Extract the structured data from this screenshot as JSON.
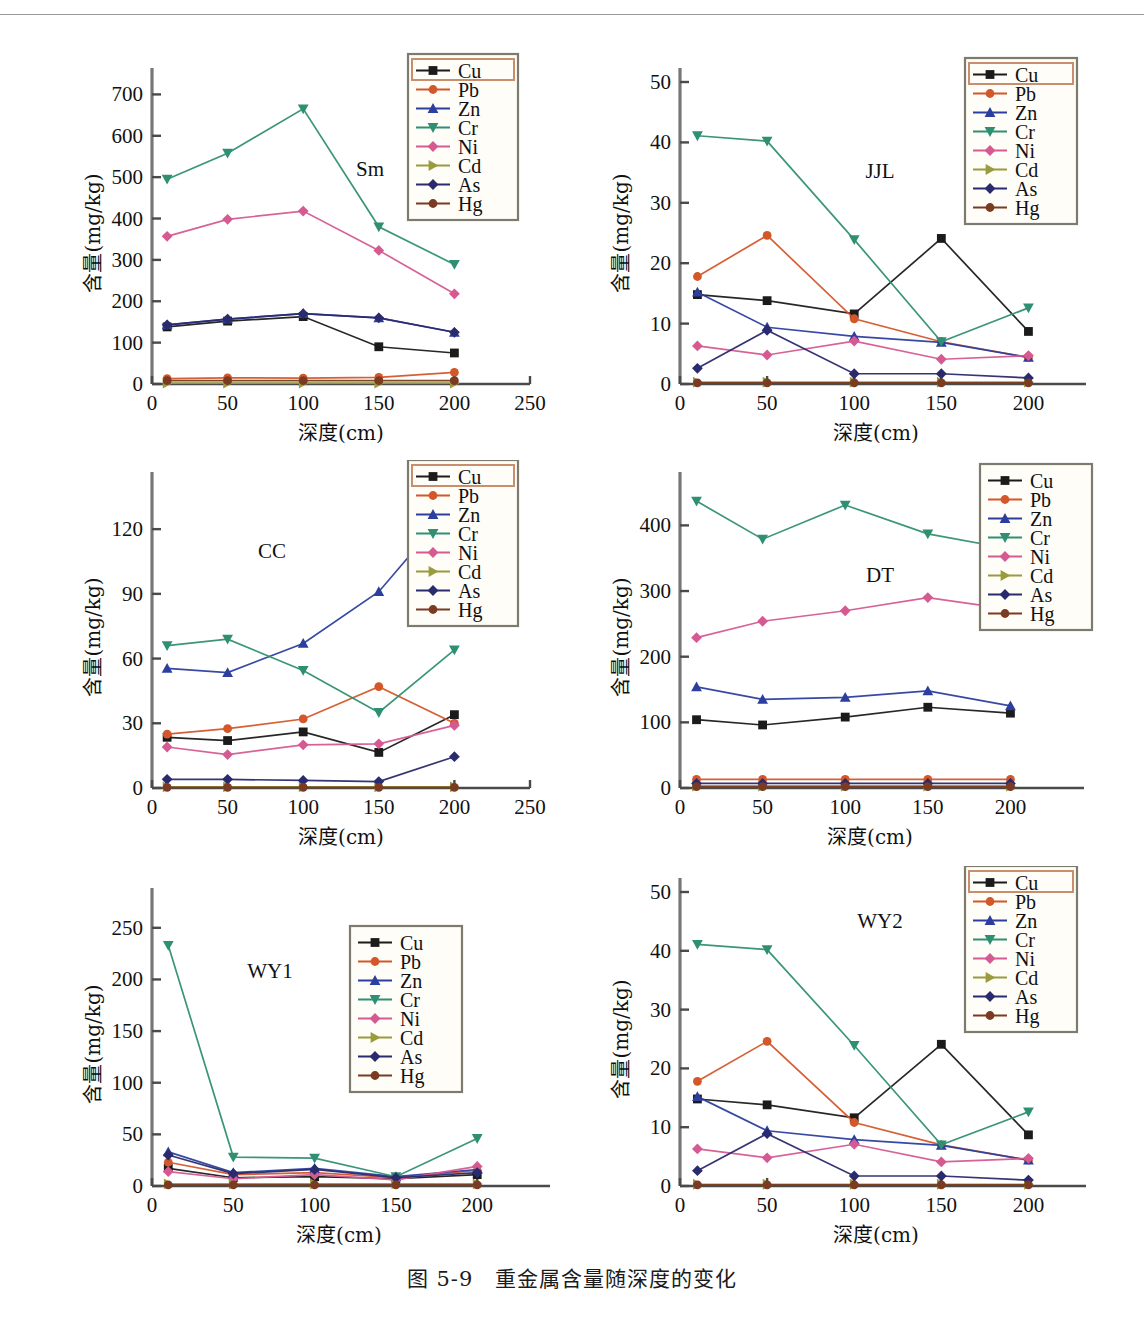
{
  "figure": {
    "caption": "图 5-9　重金属含量随深度的变化",
    "axis_x_label": "深度(cm)",
    "axis_y_label": "含量(mg/kg)"
  },
  "series_meta": [
    {
      "name": "Cu",
      "color": "#1b1b1b",
      "marker": "square"
    },
    {
      "name": "Pb",
      "color": "#d4572a",
      "marker": "circle"
    },
    {
      "name": "Zn",
      "color": "#2c3f9e",
      "marker": "triangle-up"
    },
    {
      "name": "Cr",
      "color": "#2f8f72",
      "marker": "triangle-down"
    },
    {
      "name": "Ni",
      "color": "#d55a92",
      "marker": "diamond"
    },
    {
      "name": "Cd",
      "color": "#9a9b3c",
      "marker": "triangle-right"
    },
    {
      "name": "As",
      "color": "#2a2a6e",
      "marker": "diamond"
    },
    {
      "name": "Hg",
      "color": "#7a3b22",
      "marker": "circle"
    }
  ],
  "legend_labels": [
    "Cu",
    "Pb",
    "Zn",
    "Cr",
    "Ni",
    "Cd",
    "As",
    "Hg"
  ],
  "chart_data": [
    {
      "type": "line",
      "title": "Sm",
      "xlabel": "深度(cm)",
      "ylabel": "含量(mg/kg)",
      "x": [
        10,
        50,
        100,
        150,
        200
      ],
      "xticks": [
        0,
        50,
        100,
        150,
        200,
        250
      ],
      "yticks": [
        0,
        100,
        200,
        300,
        400,
        500,
        600,
        700
      ],
      "xlim": [
        0,
        250
      ],
      "ylim": [
        0,
        730
      ],
      "grid": false,
      "legend_position": "top-right",
      "series": [
        {
          "name": "Cu",
          "values": [
            138,
            152,
            163,
            90,
            75
          ]
        },
        {
          "name": "Pb",
          "values": [
            13,
            15,
            14,
            16,
            28
          ]
        },
        {
          "name": "Zn",
          "values": [
            143,
            157,
            170,
            160,
            125
          ]
        },
        {
          "name": "Cr",
          "values": [
            495,
            558,
            665,
            380,
            289
          ]
        },
        {
          "name": "Ni",
          "values": [
            357,
            398,
            418,
            323,
            218
          ]
        },
        {
          "name": "Cd",
          "values": [
            2,
            2,
            2,
            2,
            2
          ]
        },
        {
          "name": "As",
          "values": [
            143,
            157,
            170,
            160,
            125
          ]
        },
        {
          "name": "Hg",
          "values": [
            8,
            8,
            8,
            8,
            8
          ]
        }
      ]
    },
    {
      "type": "line",
      "title": "JJL",
      "xlabel": "深度(cm)",
      "ylabel": "含量(mg/kg)",
      "x": [
        10,
        50,
        100,
        150,
        200
      ],
      "xticks": [
        0,
        50,
        100,
        150,
        200
      ],
      "yticks": [
        0,
        10,
        20,
        30,
        40,
        50
      ],
      "xlim": [
        0,
        225
      ],
      "ylim": [
        0,
        50
      ],
      "grid": false,
      "legend_position": "top-right",
      "series": [
        {
          "name": "Cu",
          "values": [
            14.8,
            13.8,
            11.6,
            24.1,
            8.7
          ]
        },
        {
          "name": "Pb",
          "values": [
            17.8,
            24.6,
            10.8,
            7.0,
            4.4
          ]
        },
        {
          "name": "Zn",
          "values": [
            15.2,
            9.4,
            7.9,
            6.9,
            4.4
          ]
        },
        {
          "name": "Cr",
          "values": [
            41.1,
            40.2,
            23.9,
            7.0,
            12.6
          ]
        },
        {
          "name": "Ni",
          "values": [
            6.3,
            4.8,
            7.1,
            4.1,
            4.7
          ]
        },
        {
          "name": "Cd",
          "values": [
            0.3,
            0.3,
            0.3,
            0.3,
            0.3
          ]
        },
        {
          "name": "As",
          "values": [
            2.6,
            8.9,
            1.7,
            1.7,
            1.0
          ]
        },
        {
          "name": "Hg",
          "values": [
            0.2,
            0.2,
            0.2,
            0.2,
            0.2
          ]
        }
      ]
    },
    {
      "type": "line",
      "title": "CC",
      "xlabel": "深度(cm)",
      "ylabel": "含量(mg/kg)",
      "x": [
        10,
        50,
        100,
        150,
        200
      ],
      "xticks": [
        0,
        50,
        100,
        150,
        200,
        250
      ],
      "yticks": [
        0,
        30,
        60,
        90,
        120
      ],
      "xlim": [
        0,
        250
      ],
      "ylim": [
        0,
        140
      ],
      "grid": false,
      "legend_position": "top-right",
      "series": [
        {
          "name": "Cu",
          "values": [
            23.5,
            22.0,
            26.0,
            16.5,
            34.0
          ]
        },
        {
          "name": "Pb",
          "values": [
            25.0,
            27.5,
            32.0,
            47.0,
            30.0
          ]
        },
        {
          "name": "Zn",
          "values": [
            55.5,
            53.5,
            67.0,
            91.0,
            132.0
          ]
        },
        {
          "name": "Cr",
          "values": [
            66.0,
            69.0,
            54.5,
            35.0,
            64.0
          ]
        },
        {
          "name": "Ni",
          "values": [
            19.0,
            15.5,
            20.0,
            20.5,
            29.0
          ]
        },
        {
          "name": "Cd",
          "values": [
            0.5,
            0.5,
            0.5,
            0.5,
            0.5
          ]
        },
        {
          "name": "As",
          "values": [
            4.0,
            4.0,
            3.5,
            3.0,
            14.5
          ]
        },
        {
          "name": "Hg",
          "values": [
            0.3,
            0.3,
            0.3,
            0.3,
            0.3
          ]
        }
      ]
    },
    {
      "type": "line",
      "title": "DT",
      "xlabel": "深度(cm)",
      "ylabel": "含量(mg/kg)",
      "x": [
        10,
        50,
        100,
        150,
        200
      ],
      "xticks": [
        0,
        50,
        100,
        150,
        200
      ],
      "yticks": [
        0,
        100,
        200,
        300,
        400
      ],
      "xlim": [
        0,
        230
      ],
      "ylim": [
        0,
        460
      ],
      "grid": false,
      "legend_position": "top-right",
      "series": [
        {
          "name": "Cu",
          "values": [
            104,
            96,
            108,
            123,
            114
          ]
        },
        {
          "name": "Pb",
          "values": [
            13,
            13,
            13,
            13,
            13
          ]
        },
        {
          "name": "Zn",
          "values": [
            154,
            135,
            138,
            148,
            125
          ]
        },
        {
          "name": "Cr",
          "values": [
            437,
            379,
            431,
            387,
            364
          ]
        },
        {
          "name": "Ni",
          "values": [
            229,
            254,
            270,
            290,
            272
          ]
        },
        {
          "name": "Cd",
          "values": [
            3,
            3,
            3,
            3,
            3
          ]
        },
        {
          "name": "As",
          "values": [
            7,
            7,
            7,
            7,
            7
          ]
        },
        {
          "name": "Hg",
          "values": [
            2,
            2,
            2,
            2,
            2
          ]
        }
      ]
    },
    {
      "type": "line",
      "title": "WY1",
      "xlabel": "深度(cm)",
      "ylabel": "含量(mg/kg)",
      "x": [
        10,
        50,
        100,
        150,
        200
      ],
      "xticks": [
        0,
        50,
        100,
        150,
        200
      ],
      "yticks": [
        0,
        50,
        100,
        150,
        200,
        250
      ],
      "xlim": [
        0,
        230
      ],
      "ylim": [
        0,
        275
      ],
      "grid": false,
      "legend_position": "top-right",
      "series": [
        {
          "name": "Cu",
          "values": [
            17,
            8,
            9,
            7,
            11
          ]
        },
        {
          "name": "Pb",
          "values": [
            23,
            11,
            13,
            8,
            15
          ]
        },
        {
          "name": "Zn",
          "values": [
            33,
            13,
            17,
            9,
            16
          ]
        },
        {
          "name": "Cr",
          "values": [
            233,
            28,
            27,
            9,
            46
          ]
        },
        {
          "name": "Ni",
          "values": [
            14,
            7,
            11,
            6,
            19
          ]
        },
        {
          "name": "Cd",
          "values": [
            2,
            2,
            2,
            2,
            2
          ]
        },
        {
          "name": "As",
          "values": [
            30,
            12,
            16,
            8,
            13
          ]
        },
        {
          "name": "Hg",
          "values": [
            1,
            1,
            1,
            1,
            1
          ]
        }
      ]
    },
    {
      "type": "line",
      "title": "WY2",
      "xlabel": "深度(cm)",
      "ylabel": "含量(mg/kg)",
      "x": [
        10,
        50,
        100,
        150,
        200
      ],
      "xticks": [
        0,
        50,
        100,
        150,
        200
      ],
      "yticks": [
        0,
        10,
        20,
        30,
        40,
        50
      ],
      "xlim": [
        0,
        225
      ],
      "ylim": [
        0,
        50
      ],
      "grid": false,
      "legend_position": "top-right",
      "series": [
        {
          "name": "Cu",
          "values": [
            14.8,
            13.8,
            11.6,
            24.1,
            8.7
          ]
        },
        {
          "name": "Pb",
          "values": [
            17.8,
            24.6,
            10.8,
            7.0,
            4.4
          ]
        },
        {
          "name": "Zn",
          "values": [
            15.2,
            9.4,
            7.9,
            6.9,
            4.4
          ]
        },
        {
          "name": "Cr",
          "values": [
            41.1,
            40.2,
            23.9,
            7.0,
            12.6
          ]
        },
        {
          "name": "Ni",
          "values": [
            6.3,
            4.8,
            7.1,
            4.1,
            4.7
          ]
        },
        {
          "name": "Cd",
          "values": [
            0.3,
            0.3,
            0.3,
            0.3,
            0.3
          ]
        },
        {
          "name": "As",
          "values": [
            2.6,
            8.9,
            1.7,
            1.7,
            1.0
          ]
        },
        {
          "name": "Hg",
          "values": [
            0.2,
            0.2,
            0.2,
            0.2,
            0.2
          ]
        }
      ]
    }
  ]
}
